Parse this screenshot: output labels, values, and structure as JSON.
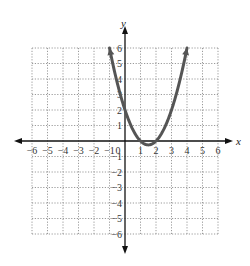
{
  "chart_data": {
    "type": "line",
    "title": "",
    "xlabel": "x",
    "ylabel": "y",
    "xlim": [
      -6,
      6
    ],
    "ylim": [
      -6,
      6
    ],
    "grid": true,
    "x_ticks": [
      "−6",
      "−5",
      "−4",
      "−3",
      "−2",
      "−1",
      "0",
      "1",
      "2",
      "3",
      "4",
      "5",
      "6"
    ],
    "y_ticks": [
      "−6",
      "−5",
      "−4",
      "−3",
      "−2",
      "−1",
      "1",
      "2",
      "3",
      "4",
      "5",
      "6"
    ],
    "series": [
      {
        "name": "parabola",
        "equation": "y = x^2 - 3x + 2",
        "x": [
          -1,
          -0.5,
          0,
          0.5,
          1,
          1.5,
          2,
          2.5,
          3,
          3.5,
          4
        ],
        "y": [
          6,
          3.75,
          2,
          0.75,
          0,
          -0.25,
          0,
          0.75,
          2,
          3.75,
          6
        ],
        "color": "#555555",
        "arrows_at_ends": true
      }
    ],
    "key_points": [
      {
        "x": 0,
        "y": 2
      },
      {
        "x": 1,
        "y": 0
      },
      {
        "x": 2,
        "y": 0
      },
      {
        "x": 3,
        "y": 2
      },
      {
        "x": 1.5,
        "y": -0.25,
        "label": "vertex"
      }
    ]
  },
  "axes": {
    "x_label": "x",
    "y_label": "y",
    "origin_label": "0"
  }
}
